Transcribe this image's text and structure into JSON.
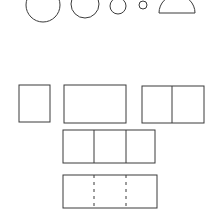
{
  "stroke_color": "#3a3a3a",
  "circles": [
    {
      "name": "circle-large",
      "cx": 43,
      "cy": 5,
      "r": 17
    },
    {
      "name": "circle-medium",
      "cx": 85,
      "cy": 4,
      "r": 14
    },
    {
      "name": "circle-small",
      "cx": 118,
      "cy": 6,
      "r": 8
    },
    {
      "name": "circle-tiny",
      "cx": 143,
      "cy": 5,
      "r": 4
    }
  ],
  "half_circle": {
    "cx": 177,
    "cy": 13,
    "r": 18
  },
  "rectangles": [
    {
      "name": "single-square",
      "x": 19,
      "y": 85,
      "w": 31,
      "h": 37,
      "dividers": [],
      "dashed": false
    },
    {
      "name": "wide-rectangle",
      "x": 64,
      "y": 85,
      "w": 62,
      "h": 38,
      "dividers": [],
      "dashed": false
    },
    {
      "name": "two-part-rectangle",
      "x": 142,
      "y": 86,
      "w": 62,
      "h": 37,
      "dividers": [
        172
      ],
      "dashed": false
    },
    {
      "name": "three-part-rectangle",
      "x": 63,
      "y": 130,
      "w": 92,
      "h": 33,
      "dividers": [
        94,
        126
      ],
      "dashed": false
    },
    {
      "name": "three-part-dashed-rectangle",
      "x": 63,
      "y": 175,
      "w": 94,
      "h": 33,
      "dividers": [
        94,
        126
      ],
      "dashed": true
    }
  ]
}
